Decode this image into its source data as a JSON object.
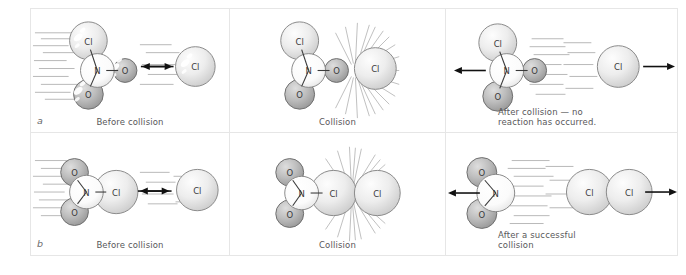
{
  "figure": {
    "background": "#ffffff",
    "panel_border_color": "#e6e6e6"
  },
  "colors": {
    "sphere_light_fill": "#ededed",
    "sphere_light_stroke": "#8a8a8a",
    "sphere_dark_fill": "#b9b9b9",
    "sphere_dark_stroke": "#6f6f6f",
    "sphere_white_fill": "#fbfbfb",
    "highlight": "#ffffff",
    "speed_line": "#9a9a9a",
    "arrow": "#111111",
    "starburst": "#9d9d9d",
    "text": "#58585a",
    "bond": "#3a3a3a"
  },
  "rows": [
    {
      "letter": "a",
      "description": "Unsuccessful collision - wrong orientation",
      "panels": [
        {
          "id": "a1",
          "caption": "Before collision",
          "molecule_label": "NO2Cl",
          "atoms": [
            "Cl",
            "N",
            "O",
            "O"
          ],
          "free_atom": "Cl",
          "arrows": [
            "right",
            "left"
          ],
          "motion": "approaching",
          "starburst": false
        },
        {
          "id": "a2",
          "caption": "Collision",
          "molecule_label": "NO2Cl",
          "atoms": [
            "Cl",
            "N",
            "O",
            "O"
          ],
          "free_atom": "Cl",
          "arrows": [],
          "motion": "contact",
          "starburst": true
        },
        {
          "id": "a3",
          "caption": "After collision — no\nreaction has occurred.",
          "caption_line1": "After collision — no",
          "caption_line2": "reaction has occurred.",
          "molecule_label": "NO2Cl",
          "atoms": [
            "Cl",
            "N",
            "O",
            "O"
          ],
          "free_atom": "Cl",
          "arrows": [
            "left",
            "right"
          ],
          "motion": "separating",
          "starburst": false
        }
      ]
    },
    {
      "letter": "b",
      "description": "Successful collision - correct orientation",
      "panels": [
        {
          "id": "b1",
          "caption": "Before collision",
          "molecule_label": "NO2Cl",
          "atoms": [
            "O",
            "N",
            "O",
            "Cl"
          ],
          "free_atom": "Cl",
          "arrows": [
            "right",
            "left"
          ],
          "motion": "approaching",
          "starburst": false
        },
        {
          "id": "b2",
          "caption": "Collision",
          "molecule_label": "NO2Cl",
          "atoms": [
            "O",
            "N",
            "O",
            "Cl"
          ],
          "free_atom": "Cl",
          "arrows": [],
          "motion": "contact",
          "starburst": true
        },
        {
          "id": "b3",
          "caption": "After a successful\ncollision",
          "caption_line1": "After a successful",
          "caption_line2": "collision",
          "molecule_label": "NO2",
          "atoms": [
            "O",
            "N",
            "O"
          ],
          "product": "Cl2",
          "arrows": [
            "left",
            "right"
          ],
          "motion": "separating",
          "starburst": false
        }
      ]
    }
  ],
  "atom_labels": {
    "chlorine": "Cl",
    "nitrogen": "N",
    "oxygen": "O"
  }
}
